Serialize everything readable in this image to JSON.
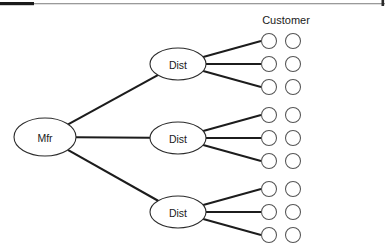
{
  "page": {
    "width": 392,
    "height": 248,
    "background": "#ffffff",
    "ink_color": "#1c1c1c",
    "circle_stroke_color": "#555555"
  },
  "header": {
    "rule_dark_color": "#1a1a1a",
    "rule_light_color": "#9a9a9a",
    "corner_tick_color": "#2a2a2a"
  },
  "diagram": {
    "type": "network-tree",
    "title": "",
    "manufacturer": {
      "label": "Mfr",
      "cx": 45,
      "cy": 137,
      "rx": 31,
      "ry": 19
    },
    "distributors": [
      {
        "label": "Dist",
        "cx": 178,
        "cy": 64,
        "rx": 28,
        "ry": 16
      },
      {
        "label": "Dist",
        "cx": 178,
        "cy": 138,
        "rx": 28,
        "ry": 16
      },
      {
        "label": "Dist",
        "cx": 178,
        "cy": 212,
        "rx": 28,
        "ry": 16
      }
    ],
    "customers": {
      "heading": "Customer",
      "heading_x": 286,
      "heading_y": 24,
      "radius": 7.5,
      "column_x": [
        269,
        293
      ],
      "groups": [
        {
          "rows_y": [
            41,
            64,
            87
          ]
        },
        {
          "rows_y": [
            115,
            138,
            161
          ]
        },
        {
          "rows_y": [
            189,
            212,
            235
          ]
        }
      ]
    },
    "edges": {
      "mfr_to_dist_count": 3,
      "dist_to_customer_per_dist": 3,
      "total_customer_nodes": 18
    }
  }
}
